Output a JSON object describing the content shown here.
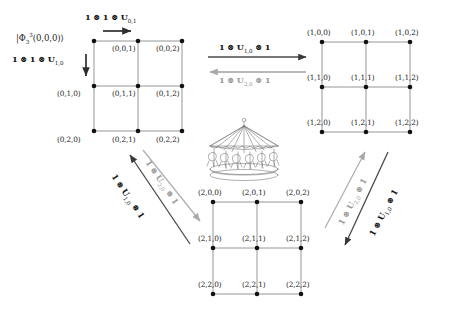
{
  "figure": {
    "background_color": "#ffffff",
    "dark_color": "#3a3a3a",
    "gray_color": "#a8a8a8",
    "node_color": "#111111"
  },
  "initial_state": {
    "label": "|Φ",
    "sup": "3",
    "sub": "3",
    "args": "(0,0,0)⟩"
  },
  "grids": [
    {
      "id": "grid-0",
      "name": "grid-block-0",
      "origin_x": 94,
      "origin_y": 41,
      "cell_w": 44,
      "cell_h": 45,
      "nodes": [
        {
          "label": "(0,0,0)",
          "row": 0,
          "col": 0,
          "label_pos": "outside-left-top",
          "hidden": true
        },
        {
          "label": "(0,0,1)",
          "row": 0,
          "col": 1,
          "label_pos": "below-left"
        },
        {
          "label": "(0,0,2)",
          "row": 0,
          "col": 2,
          "label_pos": "below-left"
        },
        {
          "label": "(0,1,0)",
          "row": 1,
          "col": 0,
          "label_pos": "left-above"
        },
        {
          "label": "(0,1,1)",
          "row": 1,
          "col": 1,
          "label_pos": "below-left"
        },
        {
          "label": "(0,1,2)",
          "row": 1,
          "col": 2,
          "label_pos": "below-left"
        },
        {
          "label": "(0,2,0)",
          "row": 2,
          "col": 0,
          "label_pos": "below-left"
        },
        {
          "label": "(0,2,1)",
          "row": 2,
          "col": 1,
          "label_pos": "below-left"
        },
        {
          "label": "(0,2,2)",
          "row": 2,
          "col": 2,
          "label_pos": "below-left"
        }
      ]
    },
    {
      "id": "grid-1",
      "name": "grid-block-1",
      "origin_x": 322,
      "origin_y": 42,
      "cell_w": 44,
      "cell_h": 45,
      "nodes": [
        {
          "label": "(1,0,0)",
          "row": 0,
          "col": 0,
          "label_pos": "above"
        },
        {
          "label": "(1,0,1)",
          "row": 0,
          "col": 1,
          "label_pos": "above"
        },
        {
          "label": "(1,0,2)",
          "row": 0,
          "col": 2,
          "label_pos": "above"
        },
        {
          "label": "(1,1,0)",
          "row": 1,
          "col": 0,
          "label_pos": "above"
        },
        {
          "label": "(1,1,1)",
          "row": 1,
          "col": 1,
          "label_pos": "above"
        },
        {
          "label": "(1,1,2)",
          "row": 1,
          "col": 2,
          "label_pos": "above"
        },
        {
          "label": "(1,2,0)",
          "row": 2,
          "col": 0,
          "label_pos": "above"
        },
        {
          "label": "(1,2,1)",
          "row": 2,
          "col": 1,
          "label_pos": "above"
        },
        {
          "label": "(1,2,2)",
          "row": 2,
          "col": 2,
          "label_pos": "above"
        }
      ]
    },
    {
      "id": "grid-2",
      "name": "grid-block-2",
      "origin_x": 213,
      "origin_y": 202,
      "cell_w": 44,
      "cell_h": 46,
      "nodes": [
        {
          "label": "(2,0,0)",
          "row": 0,
          "col": 0,
          "label_pos": "above"
        },
        {
          "label": "(2,0,1)",
          "row": 0,
          "col": 1,
          "label_pos": "above"
        },
        {
          "label": "(2,0,2)",
          "row": 0,
          "col": 2,
          "label_pos": "above"
        },
        {
          "label": "(2,1,0)",
          "row": 1,
          "col": 0,
          "label_pos": "above"
        },
        {
          "label": "(2,1,1)",
          "row": 1,
          "col": 1,
          "label_pos": "above"
        },
        {
          "label": "(2,1,2)",
          "row": 1,
          "col": 2,
          "label_pos": "above"
        },
        {
          "label": "(2,2,0)",
          "row": 2,
          "col": 0,
          "label_pos": "above"
        },
        {
          "label": "(2,2,1)",
          "row": 2,
          "col": 1,
          "label_pos": "above"
        },
        {
          "label": "(2,2,2)",
          "row": 2,
          "col": 2,
          "label_pos": "above"
        }
      ]
    }
  ],
  "operators": {
    "top_right_arrow": {
      "pre": "1 ⊗ 1 ⊗ U",
      "sub": "0,1",
      "tone": "dark",
      "name": "op-1-1-U01"
    },
    "top_left_down_arrow": {
      "pre": "1 ⊗ 1 ⊗ U",
      "sub": "1,0",
      "tone": "dark",
      "name": "op-1-1-U10"
    },
    "mid_forward": {
      "pre": "1 ⊗ U",
      "sub": "1,0",
      "post": " ⊗ 1",
      "tone": "dark",
      "name": "op-1-U10-1"
    },
    "mid_back": {
      "pre": "1 ⊗ U",
      "sub": "2,0",
      "post": " ⊗ 1",
      "tone": "gray",
      "name": "op-1-U20-1"
    },
    "left_up_diag": {
      "pre": "1 ⊗ U",
      "sub": "1,0",
      "post": " ⊗ 1",
      "tone": "dark",
      "name": "op-left-U10"
    },
    "left_down_diag": {
      "pre": "1 ⊗ U",
      "sub": "2,0",
      "post": " ⊗ 1",
      "tone": "gray",
      "name": "op-left-U20"
    },
    "right_up_diag": {
      "pre": "1 ⊗ U",
      "sub": "2,0",
      "post": " ⊗ 1",
      "tone": "gray",
      "name": "op-right-U20"
    },
    "right_down_diag": {
      "pre": "1 ⊗ U",
      "sub": "1,0",
      "post": " ⊗ 1",
      "tone": "dark",
      "name": "op-right-U10"
    }
  },
  "carousel": {
    "name": "carousel-illustration",
    "alt": "merry-go-round carousel line drawing",
    "x": 206,
    "y": 116,
    "width": 76,
    "height": 62
  }
}
